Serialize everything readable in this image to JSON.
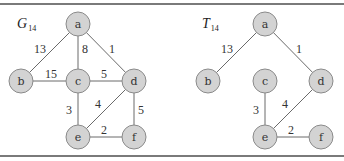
{
  "figure": {
    "graphs": [
      {
        "id": "G14",
        "title_main": "G",
        "title_sub": "14",
        "title_pos": [
          17,
          28
        ],
        "nodes": [
          {
            "id": "a",
            "label": "a",
            "x": 78,
            "y": 24
          },
          {
            "id": "b",
            "label": "b",
            "x": 21,
            "y": 81
          },
          {
            "id": "c",
            "label": "c",
            "x": 78,
            "y": 81
          },
          {
            "id": "d",
            "label": "d",
            "x": 134,
            "y": 81
          },
          {
            "id": "e",
            "label": "e",
            "x": 78,
            "y": 137
          },
          {
            "id": "f",
            "label": "f",
            "x": 134,
            "y": 137
          }
        ],
        "edges": [
          {
            "from": "a",
            "to": "b",
            "weight": "13",
            "label_pos": [
              40,
              49
            ]
          },
          {
            "from": "a",
            "to": "c",
            "weight": "8",
            "label_pos": [
              85,
              49
            ]
          },
          {
            "from": "a",
            "to": "d",
            "weight": "1",
            "label_pos": [
              112,
              49
            ]
          },
          {
            "from": "b",
            "to": "c",
            "weight": "15",
            "label_pos": [
              51,
              74
            ]
          },
          {
            "from": "c",
            "to": "d",
            "weight": "5",
            "label_pos": [
              104,
              74
            ]
          },
          {
            "from": "c",
            "to": "e",
            "weight": "3",
            "label_pos": [
              69,
              110
            ]
          },
          {
            "from": "d",
            "to": "e",
            "weight": "4",
            "label_pos": [
              98,
              104
            ]
          },
          {
            "from": "d",
            "to": "f",
            "weight": "5",
            "label_pos": [
              141,
              110
            ]
          },
          {
            "from": "e",
            "to": "f",
            "weight": "2",
            "label_pos": [
              104,
              130
            ]
          }
        ]
      },
      {
        "id": "T14",
        "title_main": "T",
        "title_sub": "14",
        "title_pos": [
          202,
          28
        ],
        "nodes": [
          {
            "id": "a",
            "label": "a",
            "x": 265,
            "y": 24
          },
          {
            "id": "b",
            "label": "b",
            "x": 208,
            "y": 81
          },
          {
            "id": "c",
            "label": "c",
            "x": 265,
            "y": 81
          },
          {
            "id": "d",
            "label": "d",
            "x": 321,
            "y": 81
          },
          {
            "id": "e",
            "label": "e",
            "x": 265,
            "y": 137
          },
          {
            "id": "f",
            "label": "f",
            "x": 321,
            "y": 137
          }
        ],
        "edges": [
          {
            "from": "a",
            "to": "b",
            "weight": "13",
            "label_pos": [
              227,
              49
            ]
          },
          {
            "from": "a",
            "to": "d",
            "weight": "1",
            "label_pos": [
              299,
              49
            ]
          },
          {
            "from": "c",
            "to": "e",
            "weight": "3",
            "label_pos": [
              256,
              110
            ]
          },
          {
            "from": "d",
            "to": "e",
            "weight": "4",
            "label_pos": [
              285,
              104
            ]
          },
          {
            "from": "e",
            "to": "f",
            "weight": "2",
            "label_pos": [
              291,
              130
            ]
          }
        ]
      }
    ],
    "node_radius": 12
  }
}
